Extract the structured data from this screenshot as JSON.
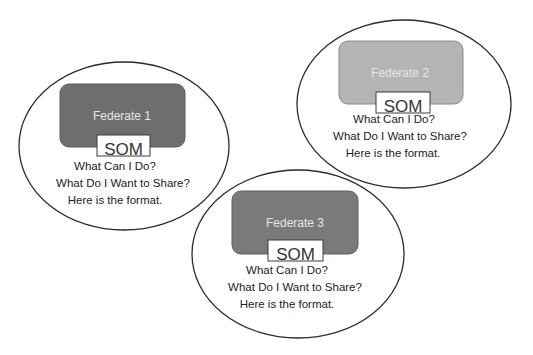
{
  "diagram": {
    "federates": [
      {
        "name": "Federate 1",
        "box_color": "#6e6e6e",
        "som_label": "SOM",
        "lines": [
          "What Can I Do?",
          "What Do I Want to Share?",
          "Here is the format."
        ]
      },
      {
        "name": "Federate 2",
        "box_color": "#b4b4b4",
        "som_label": "SOM",
        "lines": [
          "What Can I Do?",
          "What Do I Want to Share?",
          "Here is the format."
        ]
      },
      {
        "name": "Federate 3",
        "box_color": "#7a7a7a",
        "som_label": "SOM",
        "lines": [
          "What Can I Do?",
          "What Do I Want to Share?",
          "Here is the format."
        ]
      }
    ]
  }
}
